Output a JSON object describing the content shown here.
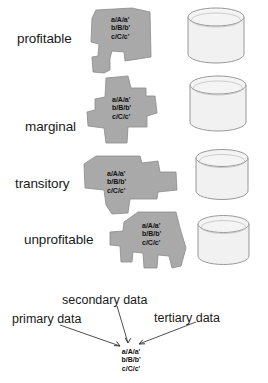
{
  "diagram": {
    "title": "",
    "data_notation_lines": [
      "a/A/a'",
      "b/B/b'",
      "c/C/c'"
    ],
    "rows": [
      {
        "label": "profitable",
        "polygon_lines": [
          "a/A/a'",
          "b/B/b'",
          "c/C/c'"
        ],
        "cylinder_size": "large"
      },
      {
        "label": "marginal",
        "polygon_lines": [
          "a/A/a'",
          "b/B/b'",
          "c/C/c'"
        ],
        "cylinder_size": "large"
      },
      {
        "label": "transitory",
        "polygon_lines": [
          "a/A/a'",
          "b/B/b'",
          "c/C/c'"
        ],
        "cylinder_size": "medium"
      },
      {
        "label": "unprofitable",
        "polygon_lines": [
          "a/A/a'",
          "b/B/b'",
          "c/C/c'"
        ],
        "cylinder_size": "medium"
      }
    ],
    "legend": {
      "primary": "primary data",
      "secondary": "secondary data",
      "tertiary": "tertiary data",
      "target_lines": [
        "a/A/a'",
        "b/B/b'",
        "c/C/c'"
      ]
    },
    "colors": {
      "polygon_fill": "#a9a9a9",
      "polygon_stroke": "#8a8a8a",
      "cylinder_fill": "#f1f1f1",
      "cylinder_stroke": "#8d8d8d",
      "text": "#1a1a1a",
      "background": "#ffffff"
    }
  }
}
